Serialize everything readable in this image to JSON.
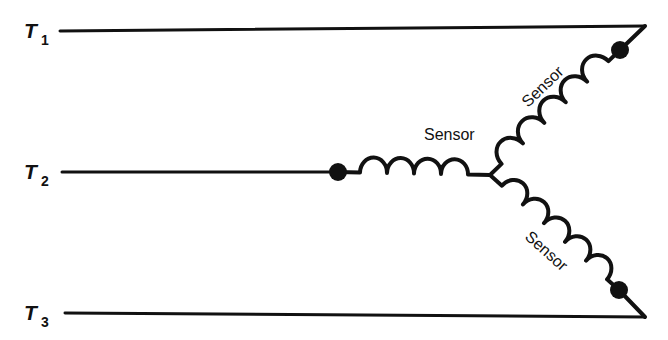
{
  "diagram": {
    "type": "electrical-schematic",
    "background_color": "#ffffff",
    "stroke_color": "#111111",
    "lines": [
      {
        "id": "t1",
        "label_base": "T",
        "label_sub": "1",
        "label_x": 24,
        "label_sub_x": 41,
        "label_y": 38,
        "label_sub_y": 45,
        "x1": 60,
        "y1": 31,
        "x2": 645,
        "y2": 26,
        "stroke_width": 3
      },
      {
        "id": "t2",
        "label_base": "T",
        "label_sub": "2",
        "label_x": 24,
        "label_sub_x": 41,
        "label_y": 179,
        "label_sub_y": 186,
        "x1": 62,
        "y1": 172,
        "x2": 338,
        "y2": 172,
        "stroke_width": 3
      },
      {
        "id": "t3",
        "label_base": "T",
        "label_sub": "3",
        "label_x": 24,
        "label_sub_x": 41,
        "label_y": 320,
        "label_sub_y": 327,
        "x1": 65,
        "y1": 313,
        "x2": 645,
        "y2": 317,
        "stroke_width": 3
      }
    ],
    "converging_edges": [
      {
        "id": "t1-taper",
        "x1": 645,
        "y1": 26,
        "x2": 620,
        "y2": 50
      },
      {
        "id": "t3-taper",
        "x1": 645,
        "y1": 317,
        "x2": 619,
        "y2": 290
      }
    ],
    "junction": {
      "x": 490,
      "y": 175
    },
    "coils": [
      {
        "id": "sensor-horizontal",
        "label": "Sensor",
        "humps": 4,
        "x1": 338,
        "y1": 172,
        "x2": 490,
        "y2": 175,
        "lead": 22,
        "radius": 15,
        "label_x": 424,
        "label_y": 140,
        "label_rotation": 0,
        "stroke_width": 4
      },
      {
        "id": "sensor-upper",
        "label": "Sensor",
        "humps": 5,
        "x1": 490,
        "y1": 175,
        "x2": 620,
        "y2": 50,
        "lead": 16,
        "radius": 14,
        "label_x": 528,
        "label_y": 108,
        "label_rotation": -44,
        "stroke_width": 4
      },
      {
        "id": "sensor-lower",
        "label": "Sensor",
        "humps": 5,
        "x1": 490,
        "y1": 175,
        "x2": 619,
        "y2": 290,
        "lead": 16,
        "radius": 14,
        "label_x": 524,
        "label_y": 238,
        "label_rotation": 42,
        "stroke_width": 4
      }
    ],
    "nodes": [
      {
        "id": "node-t2",
        "x": 338,
        "y": 172,
        "r": 9
      },
      {
        "id": "node-t1",
        "x": 620,
        "y": 50,
        "r": 9
      },
      {
        "id": "node-t3",
        "x": 619,
        "y": 290,
        "r": 9
      }
    ]
  }
}
